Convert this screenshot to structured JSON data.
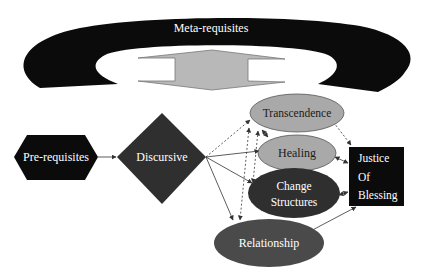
{
  "diagram": {
    "meta_label": "Meta-requisites",
    "nodes": {
      "prerequisites": "Pre-requisites",
      "discursive": "Discursive",
      "transcendence": "Transcendence",
      "healing": "Healing",
      "change_line1": "Change",
      "change_line2": "Structures",
      "relationship": "Relationship",
      "justice_line1": "Justice",
      "justice_line2": "Of",
      "justice_line3": "Blessing"
    },
    "colors": {
      "black": "#0b0b0b",
      "dark_gray": "#2f2f2f",
      "mid_gray": "#4a4a4a",
      "light_gray": "#a9a9a9",
      "arrow_fill": "#b8b8b8"
    }
  }
}
